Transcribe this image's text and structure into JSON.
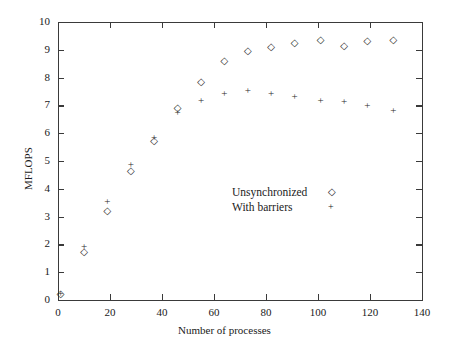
{
  "chart_data": {
    "type": "scatter",
    "title": "",
    "xlabel": "Number of processes",
    "ylabel": "MFLOPS",
    "xlim": [
      0,
      140
    ],
    "ylim": [
      0,
      10
    ],
    "xticks": [
      0,
      20,
      40,
      60,
      80,
      100,
      120,
      140
    ],
    "yticks": [
      0,
      1,
      2,
      3,
      4,
      5,
      6,
      7,
      8,
      9,
      10
    ],
    "grid": false,
    "legend_position": "center",
    "series": [
      {
        "name": "Unsynchronized",
        "marker": "diamond",
        "points": [
          [
            1,
            0.22
          ],
          [
            10,
            1.72
          ],
          [
            19,
            3.2
          ],
          [
            28,
            4.65
          ],
          [
            37,
            5.72
          ],
          [
            46,
            6.9
          ],
          [
            55,
            7.85
          ],
          [
            64,
            8.6
          ],
          [
            73,
            8.95
          ],
          [
            82,
            9.1
          ],
          [
            91,
            9.25
          ],
          [
            101,
            9.35
          ],
          [
            110,
            9.15
          ],
          [
            119,
            9.3
          ],
          [
            129,
            9.35
          ]
        ]
      },
      {
        "name": "With barriers",
        "marker": "plus",
        "points": [
          [
            1,
            0.25
          ],
          [
            10,
            1.95
          ],
          [
            19,
            3.55
          ],
          [
            28,
            4.9
          ],
          [
            37,
            5.85
          ],
          [
            46,
            6.75
          ],
          [
            55,
            7.2
          ],
          [
            64,
            7.45
          ],
          [
            73,
            7.55
          ],
          [
            82,
            7.45
          ],
          [
            91,
            7.35
          ],
          [
            101,
            7.2
          ],
          [
            110,
            7.15
          ],
          [
            119,
            7.0
          ],
          [
            129,
            6.82
          ]
        ]
      }
    ],
    "legend_entries": [
      {
        "label": "Unsynchronized",
        "symbol": "◇"
      },
      {
        "label": "With barriers",
        "symbol": "+"
      }
    ]
  },
  "axis": {
    "x_tick_labels": [
      "0",
      "20",
      "40",
      "60",
      "80",
      "100",
      "120",
      "140"
    ],
    "y_tick_labels": [
      "0",
      "1",
      "2",
      "3",
      "4",
      "5",
      "6",
      "7",
      "8",
      "9",
      "10"
    ],
    "x_title": "Number of processes",
    "y_title": "MFLOPS"
  },
  "colors": {
    "frame": "#3a3a3a",
    "marker": "#2b2b2b",
    "text": "#1a1a1a",
    "background": "#ffffff"
  }
}
